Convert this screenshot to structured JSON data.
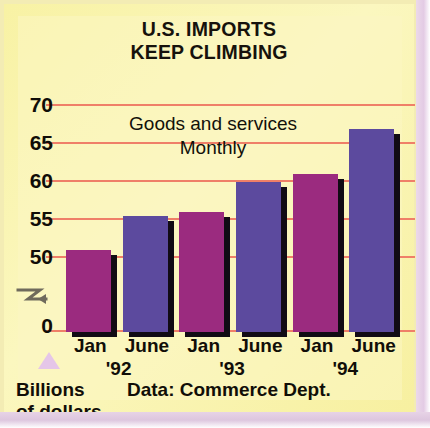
{
  "chart_data": {
    "type": "bar",
    "title": "U.S. IMPORTS KEEP CLIMBING",
    "title_line1": "U.S. IMPORTS",
    "title_line2": "KEEP CLIMBING",
    "annotation_line1": "Goods and services",
    "annotation_line2": "Monthly",
    "categories": [
      "Jan",
      "June",
      "Jan",
      "June",
      "Jan",
      "June"
    ],
    "year_groups": [
      "'92",
      "'93",
      "'94"
    ],
    "values": [
      51,
      55.5,
      56,
      60,
      61,
      67
    ],
    "xlabel": "",
    "ylabel": "Billions of dollars",
    "ylim": [
      0,
      70
    ],
    "yticks": [
      70,
      65,
      60,
      55,
      50,
      0
    ],
    "axis_break": true,
    "axis_break_between": [
      50,
      0
    ],
    "grid": true,
    "legend": "none",
    "source": "Data: Commerce Dept.",
    "bar_colors": [
      "#9b2b7f",
      "#5c4a9e",
      "#9b2b7f",
      "#5c4a9e",
      "#9b2b7f",
      "#5c4a9e"
    ],
    "series": [
      {
        "name": "Goods and services imports, monthly",
        "points": [
          {
            "label": "Jan '92",
            "value": 51
          },
          {
            "label": "June '92",
            "value": 55.5
          },
          {
            "label": "Jan '93",
            "value": 56
          },
          {
            "label": "June '93",
            "value": 60
          },
          {
            "label": "Jan '94",
            "value": 61
          },
          {
            "label": "June '94",
            "value": 67
          }
        ]
      }
    ]
  },
  "colors": {
    "background": "#f9f3a9",
    "grid": "#ef7f68",
    "bar_jan": "#9b2b7f",
    "bar_june": "#5c4a9e",
    "shadow": "#110b14",
    "frame": "#e3cbe4",
    "text": "#110e08"
  },
  "unit_label": {
    "line1": "Billions",
    "line2": "of dollars"
  }
}
